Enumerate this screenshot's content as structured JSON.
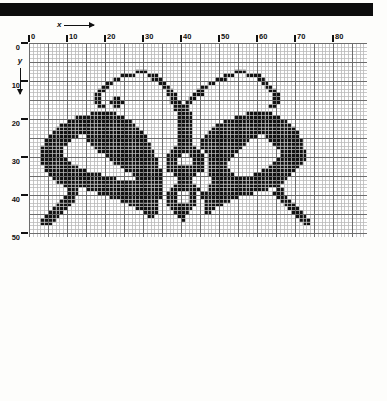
{
  "page": {
    "background_color": "#fdfdfb",
    "ink_color": "#0d0d0d"
  },
  "top_bar": {
    "name": "black-header-bar",
    "color": "#0d0d0d"
  },
  "axes": {
    "x_axis_letter": "x",
    "y_axis_letter": "y",
    "x_arrow_direction": "right",
    "y_arrow_direction": "down",
    "x_ticks": [
      "0",
      "10",
      "20",
      "30",
      "40",
      "50",
      "60",
      "70",
      "80"
    ],
    "y_ticks": [
      "0",
      "10",
      "20",
      "30",
      "40",
      "50"
    ],
    "x_tick_step": 10,
    "y_tick_step": 10
  },
  "grid": {
    "cols": 89,
    "rows": 51,
    "cell_px": 3.8,
    "minor_line_color": "#b9b9b9",
    "major_line_color": "#6d6d6d",
    "major_every": 5,
    "fill_color": "#111111",
    "empty_color": "#ffffff"
  },
  "chart_data": {
    "type": "heatmap",
    "xlabel": "x",
    "ylabel": "y",
    "xlim": [
      0,
      89
    ],
    "ylim": [
      51,
      0
    ],
    "grid": true,
    "legend": "none",
    "categories_x": [
      "0",
      "10",
      "20",
      "30",
      "40",
      "50",
      "60",
      "70",
      "80"
    ],
    "categories_y": [
      "0",
      "10",
      "20",
      "30",
      "40",
      "50"
    ],
    "note": "Binary pixel chart. Each row string: '1' = filled stitch (black), '0' = empty (white). 89 columns wide, 51 rows tall.",
    "rows": [
      "00000000000000000000000000000000000000000000000000000000000000000000000000000000000000000",
      "00000000000000000000000000000000000000000000000000000000000000000000000000000000000000000",
      "00000000000000000000000000000000000000000000000000000000000000000000000000000000000000000",
      "00000000000000000000000000000000000000000000000000000000000000000000000000000000000000000",
      "00000000000000000000000000000000000000000000000000000000000000000000000000000000000000000",
      "00000000000000000000000000000000000000000000000000000000000000000000000000000000000000000",
      "00000000000000000000000000000000000000000000000000000000000000000000000000000000000000000",
      "00000000000000000000000000001110000000000000000000000011100000000000000000000000000000000",
      "00000000000000000000000011110001110000000000000000011100011110000000000000000000000000000",
      "00000000000000000000001100000000111000000000000001110000000011000000000000000000000000000",
      "00000000000000000000110000000000001100000000000110000000000001100000000000000000000000000",
      "00000000000000000001100000000000000110000000011000000000000000110000000000000000000000000",
      "00000000000000000011000000000000000011000000110000000000000000011000000000000000000000000",
      "00000000000000000110000000000000000011100001110000000000000000001100000000000000000000000",
      "00000000000000000110001100000000000001100011000000000000000000001100000000000000000000000",
      "00000000000000000110011110000000000001110110000000000000000000001100000000000000000000000",
      "00000000000000000011001100000000000000111100000000000000000000011000000000000000000000000",
      "00000000000000000000000000000000000000111100000000000000000000000000000000000000000000000",
      "00000000000000001111111000000000000000011110000000000000011111110000000000000000000000000",
      "00000000000011111111111110000000000000011110000000000011111111111100000000000000000000000",
      "00000000001111111111111111100000000000011110000000011111111111111111000000000000000000000",
      "00000000111111111111111111110000000000011110000001111111111111111111100000000000000000000",
      "00000001111111111111111111111000000000011110000011111111111111111111110000000000000000000",
      "00000011111111111111111111111100000000011110000111111111111111111111111000000000000000000",
      "00000111111110011111111111111110000000011110001111111111111100111111111000000000000000000",
      "00001111111000011111111111111110000000011110011111111111110000011111111100000000000000000",
      "00001111110000001111111111111111000000011110011111111111100000001111111100000000000000000",
      "00011111100000000111111111111111000000111111011111111111000000000111111100000000000000000",
      "00011111100000000011111111111111100001111111101111111110000000000011111110000000000000000",
      "00011111100000000000111111111111100011110011110111111100000000000011111110000000000000000",
      "00011111110000000000011111111111110011100001110111111000000000000111111110000000000000000",
      "00011111111000000000001111111111110011100001110111110000000000001111111100000000000000000",
      "00001111111110000000000011111111110011111111110111110000000000011111111000000000000000000",
      "00001111111111100000000001111111111011111111110111111000000001111111110000000000000000000",
      "00000111111111111110000000011111111000111111000111111100000111111111100000000000000000000",
      "00000011111111111111111000001111111000011110000011111111111111111111000000000000000000000",
      "00000001111111111111111111111111111000011110000011111111111111111110000000000000000000000",
      "00000000011111111111111111111111111000111111000111111111111111111100000000000000000000000",
      "00000000001110011111111111111111111001111111100111111111111111100110000000000000000000000",
      "00000000001110000011111111111111111011100011011111111111111000001110000000000000000000000",
      "00000000011100000000011111111111111011100011011111111110000000000111000000000000000000000",
      "00000000111100000000000011111111110011100011001111111000000000000011100000000000000000000",
      "00000001111000000000000000111111110011111111001111100000000000000001110000000000000000000",
      "00000011110000000000000000001111110001111110001110000000000000000000111000000000000000000",
      "00000111100000000000000000000011110000111100001100000000000000000000011100000000000000000",
      "00001111000000000000000000000001100000011000000000000000000000000000001110000000000000000",
      "00011110000000000000000000000000000000001000000000000000000000000000000111000000000000000",
      "00011100000000000000000000000000000000000000000000000000000000000000000011000000000000000",
      "00000000000000000000000000000000000000000000000000000000000000000000000000000000000000000",
      "00000000000000000000000000000000000000000000000000000000000000000000000000000000000000000",
      "00000000000000000000000000000000000000000000000000000000000000000000000000000000000000000"
    ]
  }
}
